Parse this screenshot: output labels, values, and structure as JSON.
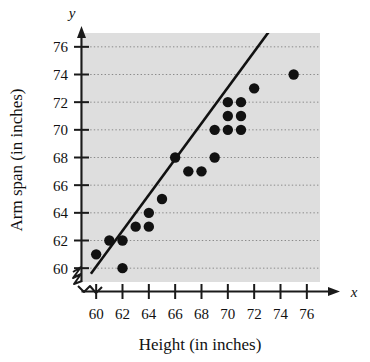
{
  "figure": {
    "plot_background_color": "#dedede",
    "gridline_color": "#8a8a8a",
    "axis_color": "#1a1a1a",
    "point_color": "#111111",
    "trend_line_color": "#111111"
  },
  "axes": {
    "x_variable_symbol": "x",
    "y_variable_symbol": "y",
    "x_title": "Height (in inches)",
    "y_title": "Arm span (in inches)",
    "x_ticks": [
      "60",
      "62",
      "64",
      "66",
      "68",
      "70",
      "72",
      "74",
      "76"
    ],
    "y_ticks": [
      "60",
      "62",
      "64",
      "66",
      "68",
      "70",
      "72",
      "74",
      "76"
    ]
  },
  "chart_data": {
    "type": "scatter",
    "title": "",
    "xlabel": "Height (in inches)",
    "ylabel": "Arm span (in inches)",
    "xlim": [
      59,
      77
    ],
    "ylim": [
      59,
      77
    ],
    "x_ticks": [
      60,
      62,
      64,
      66,
      68,
      70,
      72,
      74,
      76
    ],
    "y_ticks": [
      60,
      62,
      64,
      66,
      68,
      70,
      72,
      74,
      76
    ],
    "grid": "horizontal-dotted",
    "axis_break": "both",
    "legend": "none",
    "points": [
      {
        "x": 60,
        "y": 61
      },
      {
        "x": 61,
        "y": 62
      },
      {
        "x": 62,
        "y": 62
      },
      {
        "x": 62,
        "y": 60
      },
      {
        "x": 63,
        "y": 63
      },
      {
        "x": 64,
        "y": 63
      },
      {
        "x": 64,
        "y": 64
      },
      {
        "x": 65,
        "y": 65
      },
      {
        "x": 66,
        "y": 68
      },
      {
        "x": 67,
        "y": 67
      },
      {
        "x": 68,
        "y": 67
      },
      {
        "x": 69,
        "y": 70
      },
      {
        "x": 69,
        "y": 68
      },
      {
        "x": 70,
        "y": 72
      },
      {
        "x": 70,
        "y": 71
      },
      {
        "x": 70,
        "y": 70
      },
      {
        "x": 71,
        "y": 72
      },
      {
        "x": 71,
        "y": 71
      },
      {
        "x": 71,
        "y": 70
      },
      {
        "x": 72,
        "y": 73
      },
      {
        "x": 75,
        "y": 74
      }
    ],
    "trend_line": {
      "x_start": 59.6,
      "y_start": 59.6,
      "x_end": 73.2,
      "y_end": 77.2
    }
  }
}
